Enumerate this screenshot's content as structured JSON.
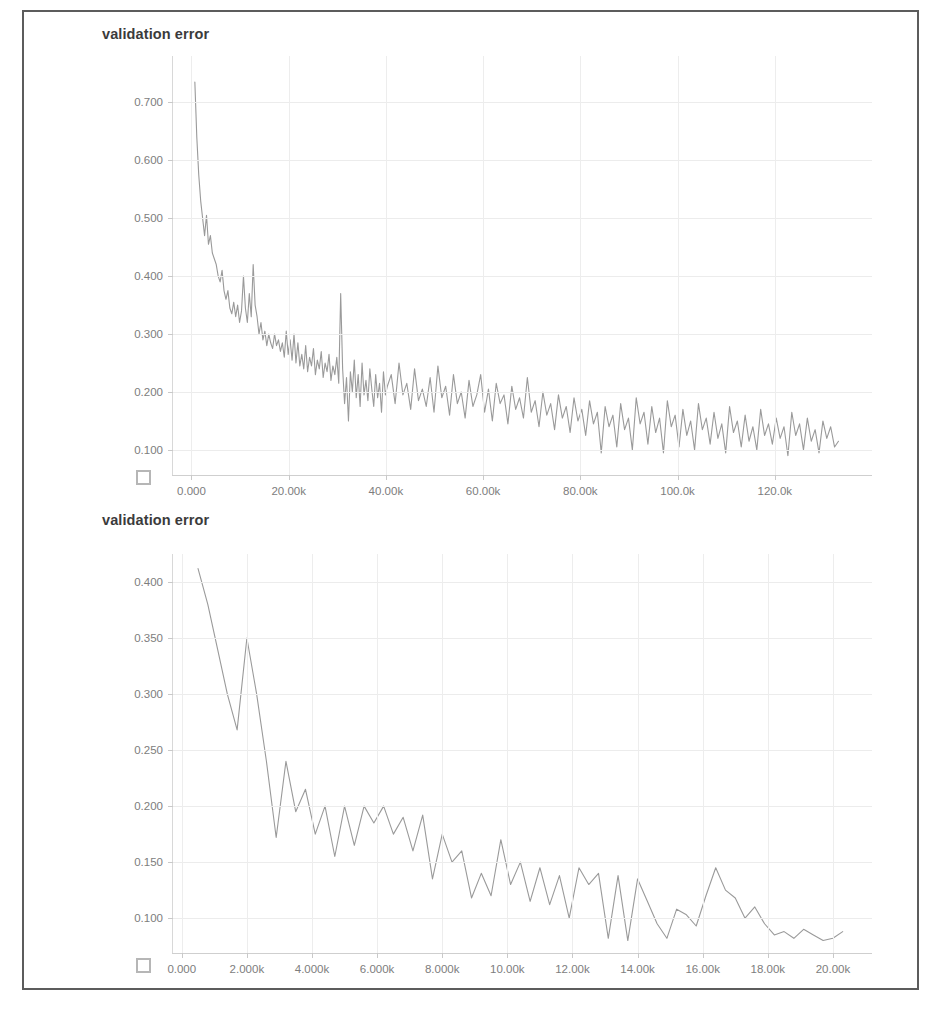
{
  "page": {
    "background": "#ffffff",
    "frame_border_color": "#5c5c5c",
    "line_color": "#9a9a9a",
    "grid_color": "#ececec",
    "tick_text_color": "#7d7d7d",
    "title_text_color": "#3b3b3b"
  },
  "charts": [
    {
      "id": "chart-1",
      "title": "validation error",
      "expand_icon": "expand-icon",
      "chart_ref": 0
    },
    {
      "id": "chart-2",
      "title": "validation error",
      "expand_icon": "expand-icon",
      "chart_ref": 1
    }
  ],
  "chart_data": [
    {
      "type": "line",
      "title": "validation error",
      "xlabel": "",
      "ylabel": "",
      "grid": true,
      "legend": "none",
      "xlim": [
        -4000,
        140000
      ],
      "ylim": [
        0.055,
        0.78
      ],
      "xticks": [
        0,
        20000,
        40000,
        60000,
        80000,
        100000,
        120000
      ],
      "xtick_labels": [
        "0.000",
        "20.00k",
        "40.00k",
        "60.00k",
        "80.00k",
        "100.0k",
        "120.0k"
      ],
      "yticks": [
        0.1,
        0.2,
        0.3,
        0.4,
        0.5,
        0.6,
        0.7
      ],
      "ytick_labels": [
        "0.100",
        "0.200",
        "0.300",
        "0.400",
        "0.500",
        "0.600",
        "0.700"
      ],
      "series": [
        {
          "name": "validation error",
          "color": "#9a9a9a",
          "x": [
            700,
            1100,
            1500,
            1900,
            2300,
            2700,
            3100,
            3500,
            3900,
            4300,
            4700,
            5100,
            5500,
            5900,
            6300,
            6700,
            7100,
            7500,
            7900,
            8300,
            8700,
            9100,
            9500,
            9900,
            10300,
            10700,
            11100,
            11500,
            11900,
            12300,
            12700,
            13100,
            13500,
            13900,
            14300,
            14700,
            15100,
            15500,
            15900,
            16300,
            16700,
            17100,
            17500,
            17900,
            18300,
            18700,
            19100,
            19500,
            19900,
            20300,
            20700,
            21100,
            21500,
            21900,
            22300,
            22700,
            23100,
            23500,
            23900,
            24300,
            24700,
            25100,
            25500,
            25900,
            26300,
            26700,
            27100,
            27500,
            27900,
            28300,
            28700,
            29100,
            29500,
            29900,
            30300,
            30700,
            31100,
            31500,
            31900,
            32300,
            32700,
            33100,
            33500,
            33900,
            34300,
            34700,
            35100,
            35500,
            35900,
            36300,
            36700,
            37100,
            37500,
            37900,
            38300,
            38700,
            39100,
            39500,
            39900,
            40300,
            41100,
            41900,
            42700,
            43500,
            44300,
            45100,
            45900,
            46700,
            47500,
            48300,
            49100,
            49900,
            50700,
            51500,
            52300,
            53100,
            53900,
            54700,
            55500,
            56300,
            57100,
            57900,
            58700,
            59500,
            60300,
            61100,
            61900,
            62700,
            63500,
            64300,
            65100,
            65900,
            66700,
            67500,
            68300,
            69100,
            69900,
            70700,
            71500,
            72300,
            73100,
            73900,
            74700,
            75500,
            76300,
            77100,
            77900,
            78700,
            79500,
            80300,
            81100,
            81900,
            82700,
            83500,
            84300,
            85100,
            85900,
            86700,
            87500,
            88300,
            89100,
            89900,
            90700,
            91500,
            92300,
            93100,
            93900,
            94700,
            95500,
            96300,
            97100,
            97900,
            98700,
            99500,
            100300,
            101100,
            101900,
            102700,
            103500,
            104300,
            105100,
            105900,
            106700,
            107500,
            108300,
            109100,
            109900,
            110700,
            111500,
            112300,
            113100,
            113900,
            114700,
            115500,
            116300,
            117100,
            117900,
            118700,
            119500,
            120300,
            121100,
            121900,
            122700,
            123500,
            124300,
            125100,
            125900,
            126700,
            127500,
            128300,
            129100,
            129900,
            130700,
            131500,
            132300,
            133100
          ],
          "y": [
            0.735,
            0.64,
            0.575,
            0.53,
            0.5,
            0.47,
            0.505,
            0.455,
            0.47,
            0.44,
            0.43,
            0.42,
            0.4,
            0.39,
            0.41,
            0.375,
            0.36,
            0.375,
            0.345,
            0.335,
            0.355,
            0.33,
            0.35,
            0.32,
            0.34,
            0.4,
            0.345,
            0.32,
            0.37,
            0.33,
            0.42,
            0.35,
            0.33,
            0.3,
            0.32,
            0.29,
            0.305,
            0.28,
            0.3,
            0.285,
            0.275,
            0.3,
            0.28,
            0.29,
            0.27,
            0.285,
            0.26,
            0.305,
            0.265,
            0.29,
            0.255,
            0.3,
            0.25,
            0.285,
            0.245,
            0.265,
            0.24,
            0.28,
            0.235,
            0.26,
            0.245,
            0.275,
            0.23,
            0.255,
            0.24,
            0.27,
            0.225,
            0.25,
            0.235,
            0.265,
            0.22,
            0.245,
            0.23,
            0.26,
            0.215,
            0.37,
            0.24,
            0.18,
            0.225,
            0.15,
            0.235,
            0.2,
            0.255,
            0.19,
            0.23,
            0.175,
            0.25,
            0.195,
            0.22,
            0.185,
            0.24,
            0.205,
            0.175,
            0.23,
            0.19,
            0.215,
            0.165,
            0.235,
            0.195,
            0.21,
            0.23,
            0.18,
            0.25,
            0.195,
            0.215,
            0.17,
            0.24,
            0.185,
            0.205,
            0.175,
            0.225,
            0.165,
            0.245,
            0.19,
            0.21,
            0.16,
            0.23,
            0.18,
            0.2,
            0.155,
            0.22,
            0.175,
            0.195,
            0.23,
            0.165,
            0.205,
            0.15,
            0.215,
            0.18,
            0.195,
            0.145,
            0.21,
            0.17,
            0.19,
            0.155,
            0.225,
            0.165,
            0.185,
            0.14,
            0.2,
            0.16,
            0.18,
            0.135,
            0.195,
            0.155,
            0.175,
            0.13,
            0.19,
            0.15,
            0.17,
            0.125,
            0.185,
            0.145,
            0.165,
            0.095,
            0.175,
            0.14,
            0.16,
            0.105,
            0.18,
            0.135,
            0.155,
            0.1,
            0.19,
            0.145,
            0.165,
            0.11,
            0.175,
            0.13,
            0.155,
            0.095,
            0.185,
            0.14,
            0.16,
            0.105,
            0.17,
            0.125,
            0.15,
            0.1,
            0.18,
            0.135,
            0.155,
            0.11,
            0.165,
            0.12,
            0.145,
            0.095,
            0.175,
            0.13,
            0.15,
            0.105,
            0.16,
            0.115,
            0.14,
            0.1,
            0.17,
            0.125,
            0.145,
            0.11,
            0.155,
            0.12,
            0.14,
            0.09,
            0.165,
            0.125,
            0.145,
            0.1,
            0.155,
            0.115,
            0.135,
            0.095,
            0.15,
            0.12,
            0.14,
            0.105,
            0.115
          ]
        }
      ]
    },
    {
      "type": "line",
      "title": "validation error",
      "xlabel": "",
      "ylabel": "",
      "grid": true,
      "legend": "none",
      "xlim": [
        -300,
        21200
      ],
      "ylim": [
        0.068,
        0.425
      ],
      "xticks": [
        0,
        2000,
        4000,
        6000,
        8000,
        10000,
        12000,
        14000,
        16000,
        18000,
        20000
      ],
      "xtick_labels": [
        "0.000",
        "2.000k",
        "4.000k",
        "6.000k",
        "8.000k",
        "10.00k",
        "12.00k",
        "14.00k",
        "16.00k",
        "18.00k",
        "20.00k"
      ],
      "yticks": [
        0.1,
        0.15,
        0.2,
        0.25,
        0.3,
        0.35,
        0.4
      ],
      "ytick_labels": [
        "0.100",
        "0.150",
        "0.200",
        "0.250",
        "0.300",
        "0.350",
        "0.400"
      ],
      "series": [
        {
          "name": "validation error",
          "color": "#9a9a9a",
          "x": [
            500,
            800,
            1100,
            1400,
            1700,
            2000,
            2300,
            2600,
            2900,
            3200,
            3500,
            3800,
            4100,
            4400,
            4700,
            5000,
            5300,
            5600,
            5900,
            6200,
            6500,
            6800,
            7100,
            7400,
            7700,
            8000,
            8300,
            8600,
            8900,
            9200,
            9500,
            9800,
            10100,
            10400,
            10700,
            11000,
            11300,
            11600,
            11900,
            12200,
            12500,
            12800,
            13100,
            13400,
            13700,
            14000,
            14300,
            14600,
            14900,
            15200,
            15500,
            15800,
            16100,
            16400,
            16700,
            17000,
            17300,
            17600,
            17900,
            18200,
            18500,
            18800,
            19100,
            19400,
            19700,
            20000,
            20300
          ],
          "y": [
            0.412,
            0.38,
            0.34,
            0.3,
            0.268,
            0.35,
            0.3,
            0.24,
            0.172,
            0.24,
            0.195,
            0.215,
            0.175,
            0.2,
            0.155,
            0.2,
            0.165,
            0.2,
            0.185,
            0.2,
            0.175,
            0.19,
            0.16,
            0.192,
            0.135,
            0.175,
            0.15,
            0.16,
            0.118,
            0.14,
            0.12,
            0.17,
            0.13,
            0.15,
            0.115,
            0.145,
            0.112,
            0.138,
            0.1,
            0.145,
            0.13,
            0.14,
            0.082,
            0.138,
            0.08,
            0.135,
            0.115,
            0.095,
            0.082,
            0.108,
            0.103,
            0.093,
            0.12,
            0.145,
            0.125,
            0.118,
            0.1,
            0.11,
            0.095,
            0.085,
            0.088,
            0.082,
            0.09,
            0.085,
            0.08,
            0.082,
            0.088
          ]
        }
      ]
    }
  ]
}
